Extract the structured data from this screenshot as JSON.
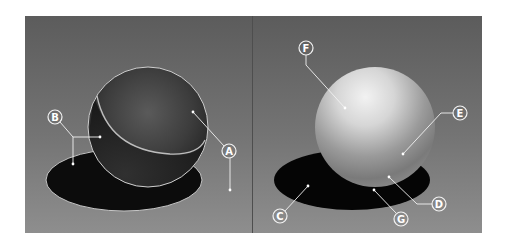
{
  "figure": {
    "colors": {
      "background_top": "#5e5e5e",
      "background_bottom": "#8c8c8c",
      "page": "#ffffff",
      "callout": "#f2f2f2",
      "shadow": "#0c0c0c",
      "divider": "#4e4e4e"
    },
    "panels": [
      {
        "name": "left-panel",
        "sphere_style": "dark terminator-outlined sphere",
        "labels": [
          {
            "id": "B",
            "text": "B"
          },
          {
            "id": "A",
            "text": "A"
          }
        ]
      },
      {
        "name": "right-panel",
        "sphere_style": "shaded light sphere",
        "labels": [
          {
            "id": "F",
            "text": "F"
          },
          {
            "id": "E",
            "text": "E"
          },
          {
            "id": "D",
            "text": "D"
          },
          {
            "id": "G",
            "text": "G"
          },
          {
            "id": "C",
            "text": "C"
          }
        ]
      }
    ]
  }
}
